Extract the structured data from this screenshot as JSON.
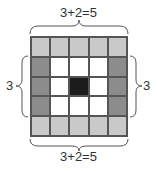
{
  "diagram": {
    "top_label": "3+2=5",
    "bottom_label": "3+2=5",
    "left_label": "3",
    "right_label": "3",
    "grid": {
      "rows": 5,
      "cols": 5,
      "colors": {
        "light": "#c9c9c9",
        "dark": "#8c8c8c",
        "center": "#1c1c1c",
        "empty": "#ffffff",
        "border": "#555555"
      },
      "cells": [
        [
          "light",
          "light",
          "light",
          "light",
          "light"
        ],
        [
          "dark",
          "empty",
          "empty",
          "empty",
          "dark"
        ],
        [
          "dark",
          "empty",
          "center",
          "empty",
          "dark"
        ],
        [
          "dark",
          "empty",
          "empty",
          "empty",
          "dark"
        ],
        [
          "light",
          "light",
          "light",
          "light",
          "light"
        ]
      ]
    }
  }
}
